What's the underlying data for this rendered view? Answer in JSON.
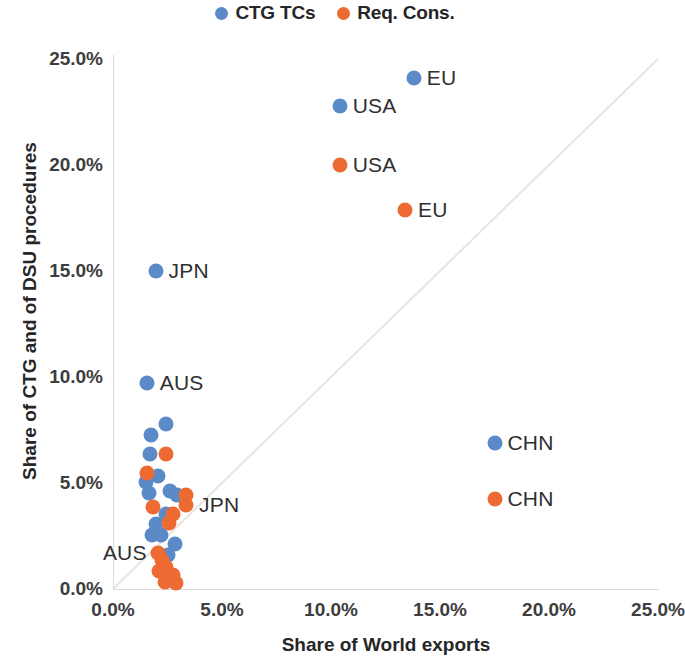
{
  "chart_data": {
    "type": "scatter",
    "title": "",
    "xlabel": "Share of World exports",
    "ylabel": "Share of CTG and of DSU procedures",
    "xlim": [
      0,
      25
    ],
    "ylim": [
      0,
      25
    ],
    "xticks": [
      "0.0%",
      "5.0%",
      "10.0%",
      "15.0%",
      "20.0%",
      "25.0%"
    ],
    "yticks": [
      "0.0%",
      "5.0%",
      "10.0%",
      "15.0%",
      "20.0%",
      "25.0%"
    ],
    "xtick_values": [
      0,
      5,
      10,
      15,
      20,
      25
    ],
    "ytick_values": [
      0,
      5,
      10,
      15,
      20,
      25
    ],
    "grid": false,
    "legend_position": "top-center",
    "reference_line": {
      "name": "45-degree parity line",
      "from": [
        0,
        0
      ],
      "to": [
        25,
        25
      ]
    },
    "series": [
      {
        "name": "CTG TCs",
        "color": "#5B8AC8",
        "points": [
          {
            "label": "EU",
            "x": 13.8,
            "y": 24.1,
            "label_side": "right"
          },
          {
            "label": "USA",
            "x": 10.4,
            "y": 22.8,
            "label_side": "right"
          },
          {
            "label": "JPN",
            "x": 1.95,
            "y": 15.0,
            "label_side": "right"
          },
          {
            "label": "AUS",
            "x": 1.55,
            "y": 9.7,
            "label_side": "right"
          },
          {
            "label": "CHN",
            "x": 17.5,
            "y": 6.9,
            "label_side": "right"
          },
          {
            "label": "",
            "x": 2.45,
            "y": 7.8,
            "label_side": "right"
          },
          {
            "label": "",
            "x": 1.75,
            "y": 7.25,
            "label_side": "right"
          },
          {
            "label": "",
            "x": 1.7,
            "y": 6.35,
            "label_side": "right"
          },
          {
            "label": "",
            "x": 1.5,
            "y": 5.05,
            "label_side": "right"
          },
          {
            "label": "",
            "x": 1.65,
            "y": 4.55,
            "label_side": "right"
          },
          {
            "label": "",
            "x": 2.05,
            "y": 5.35,
            "label_side": "right"
          },
          {
            "label": "",
            "x": 2.95,
            "y": 4.45,
            "label_side": "right"
          },
          {
            "label": "",
            "x": 2.6,
            "y": 4.6,
            "label_side": "right"
          },
          {
            "label": "",
            "x": 2.45,
            "y": 3.55,
            "label_side": "right"
          },
          {
            "label": "",
            "x": 1.95,
            "y": 3.05,
            "label_side": "right"
          },
          {
            "label": "",
            "x": 1.8,
            "y": 2.55,
            "label_side": "right"
          },
          {
            "label": "",
            "x": 2.2,
            "y": 2.55,
            "label_side": "right"
          },
          {
            "label": "",
            "x": 2.85,
            "y": 2.1,
            "label_side": "right"
          },
          {
            "label": "",
            "x": 2.5,
            "y": 1.6,
            "label_side": "right"
          }
        ]
      },
      {
        "name": "Req. Cons.",
        "color": "#ED6B33",
        "points": [
          {
            "label": "USA",
            "x": 10.4,
            "y": 20.0,
            "label_side": "right"
          },
          {
            "label": "EU",
            "x": 13.4,
            "y": 17.9,
            "label_side": "right"
          },
          {
            "label": "CHN",
            "x": 17.5,
            "y": 4.25,
            "label_side": "right"
          },
          {
            "label": "JPN",
            "x": 3.35,
            "y": 3.95,
            "label_side": "right"
          },
          {
            "label": "AUS",
            "x": 2.05,
            "y": 1.7,
            "label_side": "left"
          },
          {
            "label": "",
            "x": 2.45,
            "y": 6.35,
            "label_side": "right"
          },
          {
            "label": "",
            "x": 1.55,
            "y": 5.45,
            "label_side": "right"
          },
          {
            "label": "",
            "x": 1.85,
            "y": 3.85,
            "label_side": "right"
          },
          {
            "label": "",
            "x": 3.35,
            "y": 4.45,
            "label_side": "right"
          },
          {
            "label": "",
            "x": 2.75,
            "y": 3.55,
            "label_side": "right"
          },
          {
            "label": "",
            "x": 2.55,
            "y": 3.1,
            "label_side": "right"
          },
          {
            "label": "",
            "x": 2.25,
            "y": 1.35,
            "label_side": "right"
          },
          {
            "label": "",
            "x": 2.45,
            "y": 1.05,
            "label_side": "right"
          },
          {
            "label": "",
            "x": 2.1,
            "y": 0.85,
            "label_side": "right"
          },
          {
            "label": "",
            "x": 2.75,
            "y": 0.65,
            "label_side": "right"
          },
          {
            "label": "",
            "x": 2.4,
            "y": 0.35,
            "label_side": "right"
          },
          {
            "label": "",
            "x": 2.9,
            "y": 0.3,
            "label_side": "right"
          }
        ]
      }
    ]
  },
  "legend": {
    "entries": [
      {
        "label": "CTG TCs",
        "color": "#5B8AC8"
      },
      {
        "label": "Req. Cons.",
        "color": "#ED6B33"
      }
    ]
  }
}
